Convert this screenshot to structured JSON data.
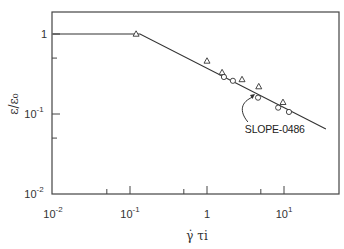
{
  "chart_data": {
    "type": "scatter",
    "title": "",
    "xlabel": "γ̇ τi",
    "ylabel": "ε/ε₀",
    "xscale": "log",
    "yscale": "log",
    "xlim": [
      0.01,
      35
    ],
    "ylim": [
      0.01,
      2.5
    ],
    "x_ticks": [
      {
        "value": 0.01,
        "base": "10",
        "exp": "-2"
      },
      {
        "value": 0.1,
        "base": "10",
        "exp": "-1"
      },
      {
        "value": 1,
        "base": "1",
        "exp": ""
      },
      {
        "value": 10,
        "base": "10",
        "exp": "1"
      }
    ],
    "y_ticks": [
      {
        "value": 1,
        "base": "1",
        "exp": ""
      },
      {
        "value": 0.1,
        "base": "10",
        "exp": "-1"
      },
      {
        "value": 0.01,
        "base": "10",
        "exp": "-2"
      }
    ],
    "grid": false,
    "legend": null,
    "series": [
      {
        "name": "triangles",
        "marker": "triangle-open",
        "points": [
          {
            "x": 0.12,
            "y": 1.0
          },
          {
            "x": 1.0,
            "y": 0.46
          },
          {
            "x": 1.57,
            "y": 0.33
          },
          {
            "x": 2.85,
            "y": 0.27
          },
          {
            "x": 4.7,
            "y": 0.22
          },
          {
            "x": 9.7,
            "y": 0.14
          }
        ]
      },
      {
        "name": "circles",
        "marker": "circle-open",
        "points": [
          {
            "x": 1.66,
            "y": 0.29
          },
          {
            "x": 2.17,
            "y": 0.26
          },
          {
            "x": 4.6,
            "y": 0.16
          },
          {
            "x": 8.4,
            "y": 0.12
          },
          {
            "x": 11.6,
            "y": 0.106
          }
        ]
      },
      {
        "name": "fit-line",
        "marker": "line",
        "points": [
          {
            "x": 0.01,
            "y": 1.0
          },
          {
            "x": 0.135,
            "y": 1.0
          },
          {
            "x": 35,
            "y": 0.065
          }
        ]
      }
    ],
    "annotations": [
      {
        "text": "SLOPE-0486",
        "meaning": "slope = -0.486",
        "x": 3.1,
        "y": 0.058,
        "arrow_to": {
          "x": 4.2,
          "y": 0.2
        }
      }
    ]
  }
}
